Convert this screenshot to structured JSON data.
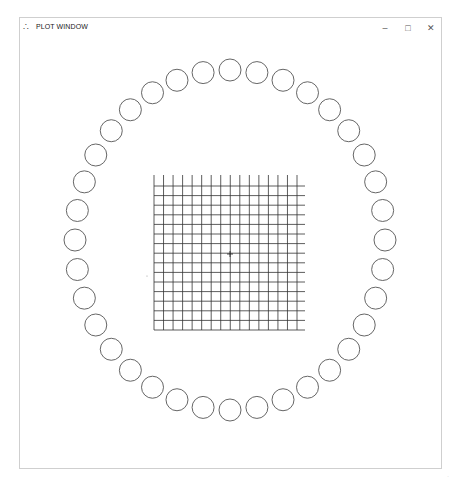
{
  "window": {
    "title": "PLOT WINDOW",
    "icon": "plot-app-icon",
    "controls": {
      "minimize": "–",
      "maximize": "□",
      "close": "✕"
    }
  },
  "plot": {
    "grid": {
      "vertical_lines": 16,
      "horizontal_lines": 16,
      "x_start": 154,
      "x_end": 297,
      "y_start": 186,
      "y_end": 330,
      "line_color": "#333333"
    },
    "crosshair": {
      "x": 230,
      "y": 254,
      "symbol": "+"
    },
    "ring": {
      "count": 36,
      "center_x": 230,
      "center_y": 240,
      "radius_x": 155,
      "radius_y": 170,
      "circle_radius": 11,
      "stroke": "#555555"
    },
    "stray_dot": {
      "x": 147,
      "y": 276
    }
  },
  "corner_mark": "·"
}
